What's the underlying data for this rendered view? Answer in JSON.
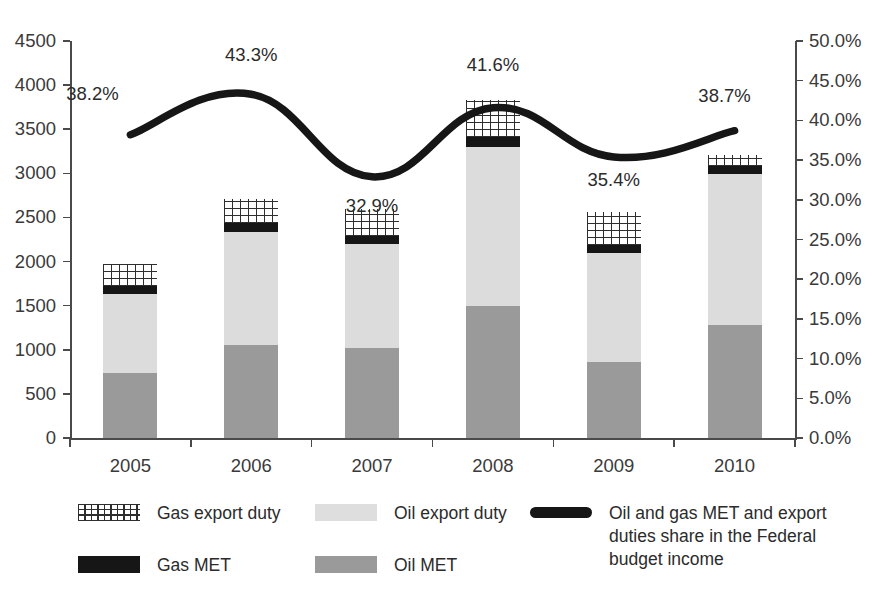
{
  "chart_data": {
    "type": "bar",
    "variant": "stacked-bar-with-line-overlay",
    "title": "",
    "subtitle": "",
    "xlabel": "",
    "ylabel": "",
    "categories": [
      "2005",
      "2006",
      "2007",
      "2008",
      "2009",
      "2010"
    ],
    "series": [
      {
        "name": "Oil MET",
        "axis": "left",
        "values": [
          736,
          1054,
          1020,
          1500,
          861,
          1281
        ]
      },
      {
        "name": "Oil export duty",
        "axis": "left",
        "values": [
          901,
          1283,
          1181,
          1800,
          1231,
          1710
        ]
      },
      {
        "name": "Gas MET",
        "axis": "left",
        "values": [
          90,
          96,
          87,
          110,
          90,
          97
        ]
      },
      {
        "name": "Gas export duty",
        "axis": "left",
        "values": [
          243,
          276,
          312,
          421,
          380,
          120
        ]
      },
      {
        "name": "Oil and gas MET and export duties share in the Federal budget income",
        "type": "line",
        "axis": "right",
        "values": [
          38.2,
          43.3,
          32.9,
          41.6,
          35.4,
          38.7
        ],
        "value_labels": [
          "38.2%",
          "43.3%",
          "32.9%",
          "41.6%",
          "35.4%",
          "38.7%"
        ]
      }
    ],
    "totals": [
      1970,
      2709,
      2600,
      3831,
      2562,
      3208
    ],
    "y_left": {
      "min": 0,
      "max": 4500,
      "step": 500,
      "ticks": [
        "0",
        "500",
        "1000",
        "1500",
        "2000",
        "2500",
        "3000",
        "3500",
        "4000",
        "4500"
      ]
    },
    "y_right": {
      "min": 0,
      "max": 50,
      "step": 5,
      "ticks": [
        "0.0%",
        "5.0%",
        "10.0%",
        "15.0%",
        "20.0%",
        "25.0%",
        "30.0%",
        "35.0%",
        "40.0%",
        "45.0%",
        "50.0%"
      ]
    },
    "grid": false,
    "legend_position": "bottom"
  },
  "legend": {
    "items": [
      {
        "key": "gas-export-duty",
        "label": "Gas export duty",
        "swatch": "hatch",
        "color": "#2e2e2e"
      },
      {
        "key": "oil-export-duty",
        "label": "Oil export duty",
        "swatch": "solid",
        "color": "#dedede"
      },
      {
        "key": "share-line",
        "label": "Oil and gas MET and export duties share in the Federal budget income",
        "swatch": "line",
        "color": "#161616"
      },
      {
        "key": "gas-met",
        "label": "Gas MET",
        "swatch": "solid",
        "color": "#161616"
      },
      {
        "key": "oil-met",
        "label": "Oil MET",
        "swatch": "solid",
        "color": "#9a9a9a"
      }
    ]
  },
  "colors": {
    "oil_met": "#9a9a9a",
    "oil_export_duty": "#dcdcdc",
    "gas_met": "#161616",
    "gas_export_duty": "#2e2e2e",
    "share_line": "#161616",
    "axis": "#4a4a4a",
    "text": "#2b2b2b",
    "background": "#ffffff"
  }
}
